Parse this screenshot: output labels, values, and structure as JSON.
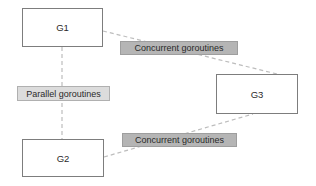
{
  "diagram": {
    "nodes": {
      "g1": {
        "label": "G1"
      },
      "g2": {
        "label": "G2"
      },
      "g3": {
        "label": "G3"
      }
    },
    "edge_labels": {
      "concurrent_top": "Concurrent goroutines",
      "parallel": "Parallel goroutines",
      "concurrent_bottom": "Concurrent goroutines"
    },
    "edges": [
      {
        "from": "g1",
        "to": "g3",
        "label": "Concurrent goroutines",
        "style": "dashed"
      },
      {
        "from": "g1",
        "to": "g2",
        "label": "Parallel goroutines",
        "style": "dashed"
      },
      {
        "from": "g2",
        "to": "g3",
        "label": "Concurrent goroutines",
        "style": "dashed"
      }
    ],
    "colors": {
      "background": "#ffffff",
      "node_fill": "#ffffff",
      "node_border": "#7d7d7d",
      "edge_line": "#bdbdbd",
      "concurrent_label_bg": "#b5b5b5",
      "concurrent_label_border": "#9e9e9e",
      "parallel_label_bg": "#dcdcdc",
      "parallel_label_border": "#b0b0b0",
      "text": "#2a2a2a"
    }
  }
}
